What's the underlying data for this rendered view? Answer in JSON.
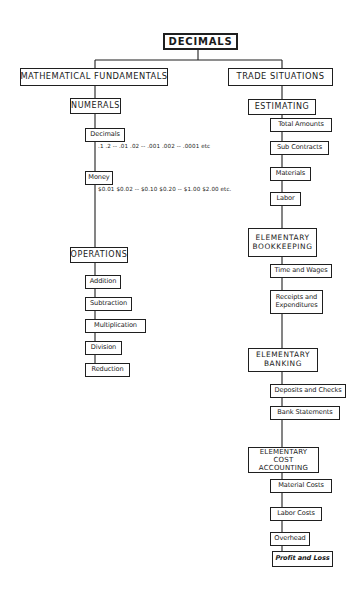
{
  "diagram": {
    "title": "DECIMALS",
    "branches": [
      {
        "label": "MATHEMATICAL FUNDAMENTALS",
        "groups": [
          {
            "label": "NUMERALS",
            "items": [
              {
                "label": "Decimals",
                "sequence": ".1 .2 -- .01 .02 -- .001 .002 -- .0001 etc"
              },
              {
                "label": "Money",
                "sequence": "$0.01 $0.02 -- $0.10 $0.20 -- $1.00 $2.00 etc."
              }
            ]
          },
          {
            "label": "OPERATIONS",
            "items": [
              {
                "label": "Addition"
              },
              {
                "label": "Subtraction"
              },
              {
                "label": "Multiplication"
              },
              {
                "label": "Division"
              },
              {
                "label": "Reduction"
              }
            ]
          }
        ]
      },
      {
        "label": "TRADE SITUATIONS",
        "groups": [
          {
            "label": "ESTIMATING",
            "items": [
              {
                "label": "Total Amounts"
              },
              {
                "label": "Sub Contracts"
              },
              {
                "label": "Materials"
              },
              {
                "label": "Labor"
              }
            ]
          },
          {
            "label_line1": "ELEMENTARY",
            "label_line2": "BOOKKEEPING",
            "items": [
              {
                "label": "Time and Wages"
              },
              {
                "label_line1": "Receipts and",
                "label_line2": "Expenditures"
              }
            ]
          },
          {
            "label_line1": "ELEMENTARY",
            "label_line2": "BANKING",
            "items": [
              {
                "label": "Deposits and Checks"
              },
              {
                "label": "Bank Statements"
              }
            ]
          },
          {
            "label_line1": "ELEMENTARY",
            "label_line2": "COST ACCOUNTING",
            "items": [
              {
                "label": "Material Costs"
              },
              {
                "label": "Labor Costs"
              },
              {
                "label": "Overhead"
              },
              {
                "label": "Profit and Loss"
              }
            ]
          }
        ]
      }
    ],
    "decimal_sequence_parts": [
      ".1",
      ".2",
      "--",
      ".01",
      ".02",
      "--",
      ".001",
      ".002",
      "--",
      ".0001",
      "etc"
    ],
    "money_sequence_parts": [
      "$0.01",
      "$0.02",
      "--",
      "$0.10",
      "$0.20",
      "--",
      "$1.00",
      "$2.00",
      "etc."
    ],
    "colors": {
      "ink": "#1f1f1f",
      "background": "#ffffff"
    }
  }
}
